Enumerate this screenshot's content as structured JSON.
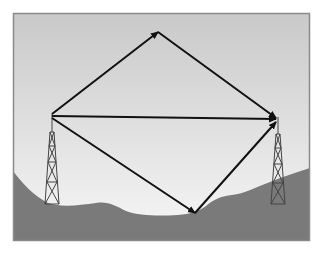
{
  "diagram": {
    "type": "radio-propagation-paths",
    "frame": {
      "x": 13,
      "y": 13,
      "width": 297,
      "height": 228
    },
    "colors": {
      "sky_top": "#c9c9c9",
      "sky_bottom": "#f7f7f7",
      "ground": "#7a7a7a",
      "frame_border": "#8a8a8a",
      "arrow": "#111111",
      "tower": "#444444",
      "background": "#ffffff"
    },
    "towers": [
      {
        "name": "transmitter-tower",
        "top": [
          52,
          114
        ],
        "base_y": 204,
        "base_half_width": 7
      },
      {
        "name": "receiver-tower",
        "top": [
          278,
          117
        ],
        "base_y": 204,
        "base_half_width": 7
      }
    ],
    "paths": [
      {
        "name": "sky-wave-up",
        "from": [
          52,
          114
        ],
        "to": [
          158,
          32
        ]
      },
      {
        "name": "sky-wave-down",
        "from": [
          158,
          32
        ],
        "to": [
          276,
          118
        ]
      },
      {
        "name": "direct-wave",
        "from": [
          52,
          116
        ],
        "to": [
          276,
          119
        ]
      },
      {
        "name": "ground-reflected-down",
        "from": [
          52,
          118
        ],
        "to": [
          195,
          213
        ]
      },
      {
        "name": "ground-reflected-up",
        "from": [
          195,
          213
        ],
        "to": [
          276,
          122
        ]
      }
    ],
    "labels": []
  }
}
